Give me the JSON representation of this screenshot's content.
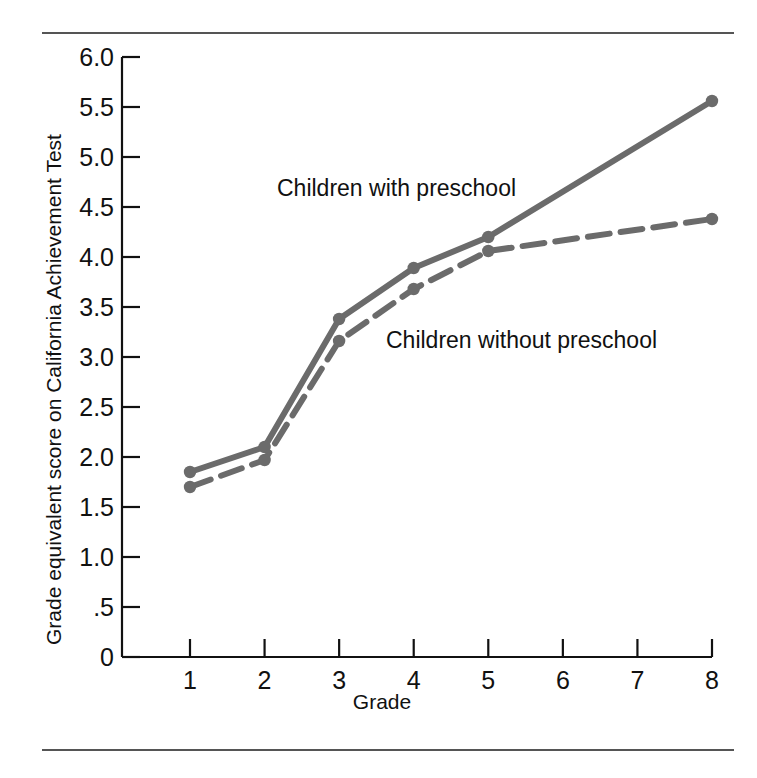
{
  "figure": {
    "background": "#ffffff",
    "rule_color": "#555555",
    "line_color": "#6b6b6b",
    "text_color": "#111111"
  },
  "chart_data": {
    "type": "line",
    "title": "",
    "xlabel": "Grade",
    "ylabel": "Grade equivalent score on California Achievement Test",
    "x": [
      1,
      2,
      3,
      4,
      5,
      8
    ],
    "categories": [
      "1",
      "2",
      "3",
      "4",
      "5",
      "8"
    ],
    "xtick_labels": [
      "1",
      "2",
      "3",
      "4",
      "5",
      "6",
      "7",
      "8"
    ],
    "xtick_values": [
      1,
      2,
      3,
      4,
      5,
      6,
      7,
      8
    ],
    "ytick_labels": [
      "0",
      ".5",
      "1.0",
      "1.5",
      "2.0",
      "2.5",
      "3.0",
      "3.5",
      "4.0",
      "4.5",
      "5.0",
      "5.5",
      "6.0"
    ],
    "ytick_values": [
      0,
      0.5,
      1.0,
      1.5,
      2.0,
      2.5,
      3.0,
      3.5,
      4.0,
      4.5,
      5.0,
      5.5,
      6.0
    ],
    "xlim": [
      1,
      8
    ],
    "ylim": [
      0,
      6.0
    ],
    "grid": false,
    "legend_position": "inline-annotations",
    "series": [
      {
        "name": "Children with preschool",
        "style": "solid",
        "marker": "circle",
        "color": "#6b6b6b",
        "values": [
          1.85,
          2.1,
          3.38,
          3.89,
          4.2,
          5.56
        ]
      },
      {
        "name": "Children without preschool",
        "style": "dashed",
        "marker": "circle",
        "color": "#6b6b6b",
        "values": [
          1.7,
          1.97,
          3.16,
          3.68,
          4.06,
          4.38
        ]
      }
    ],
    "annotations": [
      {
        "text": "Children with preschool",
        "x_px": 277,
        "y_px": 175
      },
      {
        "text": "Children without preschool",
        "x_px": 386,
        "y_px": 327
      }
    ]
  }
}
